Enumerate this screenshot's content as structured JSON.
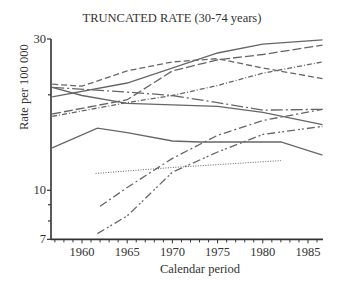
{
  "chart_data": {
    "type": "line",
    "title": "TRUNCATED RATE (30-74 years)",
    "xlabel": "Calendar period",
    "ylabel": "Rate per 100 000",
    "yscale": "log",
    "xlim": [
      1956.7,
      1986.8
    ],
    "ylim": [
      7,
      30
    ],
    "x_ticks": [
      1960,
      1965,
      1970,
      1975,
      1980,
      1985
    ],
    "y_tick_labels": [
      30,
      10,
      7
    ],
    "y_minor_ticks": [
      20,
      9,
      8
    ],
    "grid": false,
    "legend": null,
    "series": [
      {
        "name": "series-1",
        "style": "solid",
        "x": [
          1956.7,
          1965,
          1975,
          1980,
          1986.6
        ],
        "y": [
          19.7,
          21.8,
          27.1,
          28.9,
          29.8
        ]
      },
      {
        "name": "series-2",
        "style": "dashed",
        "x": [
          1956.7,
          1960,
          1965,
          1970,
          1975,
          1980,
          1986.6
        ],
        "y": [
          21.6,
          21.3,
          23.8,
          25.4,
          26.0,
          24.3,
          22.5
        ]
      },
      {
        "name": "series-3",
        "style": "long-dash",
        "x": [
          1956.7,
          1965,
          1970,
          1975,
          1980,
          1986.6
        ],
        "y": [
          17.4,
          19.3,
          23.8,
          25.8,
          26.8,
          28.7
        ]
      },
      {
        "name": "series-4",
        "style": "dash-dot-short",
        "x": [
          1956.7,
          1965,
          1970,
          1975,
          1980,
          1986.6
        ],
        "y": [
          17.1,
          18.9,
          19.9,
          21.4,
          23.4,
          25.4
        ]
      },
      {
        "name": "series-5",
        "style": "long-dash-dot",
        "x": [
          1956.7,
          1965,
          1970,
          1975,
          1980,
          1986.6
        ],
        "y": [
          21.1,
          20.4,
          19.9,
          18.9,
          17.9,
          18.0
        ]
      },
      {
        "name": "series-6",
        "style": "solid",
        "x": [
          1956.7,
          1960,
          1965,
          1970,
          1975,
          1980,
          1986.6
        ],
        "y": [
          21.1,
          19.9,
          18.8,
          18.6,
          18.4,
          17.6,
          16.1
        ]
      },
      {
        "name": "series-7",
        "style": "solid",
        "x": [
          1956.7,
          1961.7,
          1965,
          1970,
          1973,
          1982,
          1986.6
        ],
        "y": [
          13.6,
          15.7,
          15.2,
          14.3,
          14.2,
          14.2,
          12.9
        ]
      },
      {
        "name": "series-8",
        "style": "dash-dot",
        "x": [
          1962,
          1965,
          1970,
          1975,
          1980,
          1986.6
        ],
        "y": [
          8.9,
          10.2,
          12.6,
          14.9,
          16.6,
          18.0
        ]
      },
      {
        "name": "series-9",
        "style": "dash-dot-dot",
        "x": [
          1961.7,
          1965,
          1970,
          1975,
          1980,
          1986.6
        ],
        "y": [
          7.3,
          8.3,
          11.4,
          13.2,
          15.0,
          15.9
        ]
      },
      {
        "name": "series-10",
        "style": "dotted",
        "x": [
          1961.5,
          1970,
          1982
        ],
        "y": [
          11.3,
          11.8,
          12.4
        ]
      }
    ]
  },
  "labels": {
    "title": "TRUNCATED RATE (30-74 years)",
    "xlabel": "Calendar period",
    "ylabel": "Rate per 100 000",
    "yticks": [
      "30",
      "10",
      "7"
    ],
    "xticks": [
      "1960",
      "1965",
      "1970",
      "1975",
      "1980",
      "1985"
    ]
  }
}
